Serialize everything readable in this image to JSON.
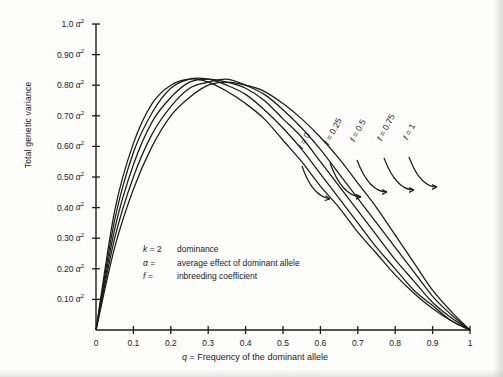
{
  "figure": {
    "background_color": "#fdfdfc",
    "ink_color": "#1a1a1a"
  },
  "axes": {
    "y_title": "Total genetic variance",
    "x_title_symbol": "q",
    "x_title_rest": " = Frequency of the dominant allele",
    "y_ticks": [
      {
        "value": 0.1,
        "text": "0.10",
        "unit": "α",
        "exponent": "2"
      },
      {
        "value": 0.2,
        "text": "0.20",
        "unit": "α",
        "exponent": "2"
      },
      {
        "value": 0.3,
        "text": "0.30",
        "unit": "α",
        "exponent": "2"
      },
      {
        "value": 0.4,
        "text": "0.40",
        "unit": "α",
        "exponent": "2"
      },
      {
        "value": 0.5,
        "text": "0.50",
        "unit": "α",
        "exponent": "2"
      },
      {
        "value": 0.6,
        "text": "0.60",
        "unit": "α",
        "exponent": "2"
      },
      {
        "value": 0.7,
        "text": "0.70",
        "unit": "α",
        "exponent": "2"
      },
      {
        "value": 0.8,
        "text": "0.80",
        "unit": "α",
        "exponent": "2"
      },
      {
        "value": 0.9,
        "text": "0.90",
        "unit": "α",
        "exponent": "2"
      },
      {
        "value": 1.0,
        "text": "1.0",
        "unit": "α",
        "exponent": "2"
      }
    ],
    "x_ticks": [
      {
        "value": 0.0,
        "text": "0"
      },
      {
        "value": 0.1,
        "text": "0.1"
      },
      {
        "value": 0.2,
        "text": "0.2"
      },
      {
        "value": 0.3,
        "text": "0.3"
      },
      {
        "value": 0.4,
        "text": "0.4"
      },
      {
        "value": 0.5,
        "text": "0.5"
      },
      {
        "value": 0.6,
        "text": "0.6"
      },
      {
        "value": 0.7,
        "text": "0.7"
      },
      {
        "value": 0.8,
        "text": "0.8"
      },
      {
        "value": 0.9,
        "text": "0.9"
      },
      {
        "value": 1.0,
        "text": "1"
      }
    ]
  },
  "legend": {
    "rows": [
      {
        "symbol": "k",
        "equals": " = ",
        "value": "2",
        "description": "dominance"
      },
      {
        "symbol": "α",
        "equals": " = ",
        "value": "",
        "description": "average effect of dominant allele"
      },
      {
        "symbol": "f",
        "equals": " = ",
        "value": "",
        "description": "inbreeding coefficient"
      }
    ]
  },
  "curve_labels": [
    {
      "symbol": "f",
      "equals": " = ",
      "value": "0",
      "rotation": -62
    },
    {
      "symbol": "f",
      "equals": " = ",
      "value": "0.25",
      "rotation": -62
    },
    {
      "symbol": "f",
      "equals": " = ",
      "value": "0.5",
      "rotation": -62
    },
    {
      "symbol": "f",
      "equals": " = ",
      "value": "0.75",
      "rotation": -62
    },
    {
      "symbol": "f",
      "equals": " = ",
      "value": "1",
      "rotation": -62
    }
  ],
  "chart_data": {
    "type": "line",
    "title": "",
    "xlabel": "q = Frequency of the dominant allele",
    "ylabel": "Total genetic variance",
    "xlim": [
      0,
      1
    ],
    "ylim": [
      0,
      1
    ],
    "x_unit": "",
    "y_unit": "alpha squared",
    "grid": false,
    "legend_position": "inline-curve-labels",
    "x": [
      0,
      0.05,
      0.1,
      0.15,
      0.2,
      0.25,
      0.3,
      0.35,
      0.4,
      0.45,
      0.5,
      0.55,
      0.6,
      0.65,
      0.7,
      0.75,
      0.8,
      0.85,
      0.9,
      0.95,
      1
    ],
    "series": [
      {
        "name": "f = 0",
        "label": "f = 0",
        "values": [
          0.0,
          0.27,
          0.46,
          0.6,
          0.7,
          0.76,
          0.8,
          0.81,
          0.8,
          0.78,
          0.74,
          0.69,
          0.63,
          0.56,
          0.48,
          0.4,
          0.31,
          0.22,
          0.13,
          0.06,
          0.0
        ]
      },
      {
        "name": "f = 0.25",
        "label": "f = 0.25",
        "values": [
          0.0,
          0.3,
          0.5,
          0.64,
          0.73,
          0.79,
          0.81,
          0.82,
          0.8,
          0.77,
          0.72,
          0.66,
          0.59,
          0.51,
          0.43,
          0.35,
          0.27,
          0.19,
          0.11,
          0.05,
          0.0
        ]
      },
      {
        "name": "f = 0.5",
        "label": "f = 0.5",
        "values": [
          0.0,
          0.33,
          0.54,
          0.68,
          0.76,
          0.81,
          0.82,
          0.81,
          0.79,
          0.75,
          0.69,
          0.63,
          0.55,
          0.47,
          0.39,
          0.31,
          0.23,
          0.16,
          0.09,
          0.04,
          0.0
        ]
      },
      {
        "name": "f = 0.75",
        "label": "f = 0.75",
        "values": [
          0.0,
          0.36,
          0.58,
          0.71,
          0.79,
          0.82,
          0.82,
          0.8,
          0.77,
          0.72,
          0.66,
          0.59,
          0.51,
          0.43,
          0.35,
          0.27,
          0.2,
          0.13,
          0.08,
          0.03,
          0.0
        ]
      },
      {
        "name": "f = 1",
        "label": "f = 1",
        "values": [
          0.0,
          0.39,
          0.61,
          0.74,
          0.8,
          0.82,
          0.81,
          0.78,
          0.74,
          0.69,
          0.62,
          0.55,
          0.47,
          0.4,
          0.32,
          0.25,
          0.18,
          0.12,
          0.07,
          0.03,
          0.0
        ]
      }
    ]
  }
}
